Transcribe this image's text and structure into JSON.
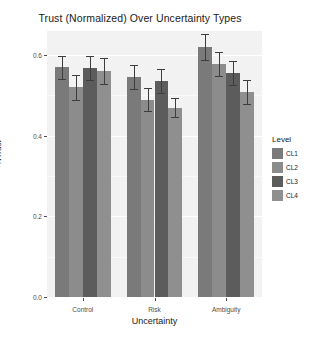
{
  "chart_data": {
    "type": "bar",
    "title": "Trust (Normalized) Over Uncertainty Types",
    "xlabel": "Uncertainty",
    "ylabel": "NTrust",
    "categories": [
      "Control",
      "Risk",
      "Ambiguity"
    ],
    "ylim": [
      0.0,
      0.66
    ],
    "yticks": [
      0.0,
      0.2,
      0.4,
      0.6
    ],
    "ytick_labels": [
      "0.0",
      "0.2",
      "0.4",
      "0.6"
    ],
    "grid": true,
    "legend_position": "right",
    "legend_title": "Level",
    "series": [
      {
        "name": "CL1",
        "color": "#7a7a7a",
        "values": [
          0.57,
          0.545,
          0.62
        ],
        "errors": [
          0.028,
          0.03,
          0.032
        ]
      },
      {
        "name": "CL2",
        "color": "#8c8c8c",
        "values": [
          0.52,
          0.49,
          0.578
        ],
        "errors": [
          0.03,
          0.028,
          0.03
        ]
      },
      {
        "name": "CL3",
        "color": "#5c5c5c",
        "values": [
          0.568,
          0.535,
          0.556
        ],
        "errors": [
          0.03,
          0.03,
          0.03
        ]
      },
      {
        "name": "CL4",
        "color": "#8f8f8f",
        "values": [
          0.56,
          0.47,
          0.508
        ],
        "errors": [
          0.032,
          0.024,
          0.03
        ]
      }
    ]
  },
  "colors": {
    "panel_background": "#f2f2f2",
    "gridline": "#ffffff",
    "error_bar": "#3d3d3d",
    "text": "#1a1a1a",
    "axis_text": "#4d4d4d"
  }
}
